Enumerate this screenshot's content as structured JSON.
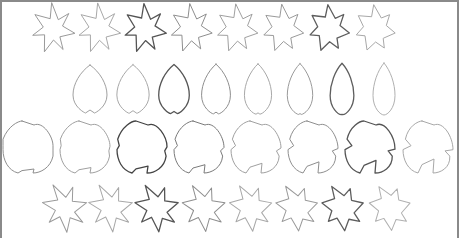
{
  "figure": {
    "rows": [
      {
        "name": "maple-row-top",
        "shape": "maple",
        "y_center": 29,
        "scale": 1.0,
        "rotation": 0,
        "x_centers": [
          53,
          99,
          145,
          191,
          237,
          283,
          329,
          375
        ],
        "strokes": [
          "#9a9a9a",
          "#a8a8a8",
          "#555555",
          "#8e8e8e",
          "#a0a0a0",
          "#9a9a9a",
          "#5e5e5e",
          "#a8a8a8"
        ]
      },
      {
        "name": "ovate-row",
        "shape": "ovate",
        "y_center": 89,
        "scale": 1.0,
        "rotation": 0,
        "x_centers": [
          90,
          133,
          174,
          216,
          258,
          300,
          342,
          384
        ],
        "strokes": [
          "#a0a0a0",
          "#a8a8a8",
          "#555555",
          "#8e8e8e",
          "#a8a8a8",
          "#9a9a9a",
          "#5e5e5e",
          "#b0b0b0"
        ]
      },
      {
        "name": "heart-lobed-row",
        "shape": "heart-lobed",
        "y_center": 147,
        "scale": 1.0,
        "rotation": 0,
        "x_centers": [
          28,
          85,
          142,
          199,
          256,
          313,
          370,
          428
        ],
        "strokes": [
          "#8e8e8e",
          "#a0a0a0",
          "#444444",
          "#7a7a7a",
          "#a0a0a0",
          "#8e8e8e",
          "#555555",
          "#a8a8a8"
        ]
      },
      {
        "name": "maple-row-bottom",
        "shape": "maple",
        "y_center": 208,
        "scale": 1.0,
        "rotation": -25,
        "x_centers": [
          65,
          111,
          157,
          204,
          251,
          297,
          343,
          390
        ],
        "strokes": [
          "#9a9a9a",
          "#a8a8a8",
          "#555555",
          "#8e8e8e",
          "#a8a8a8",
          "#9a9a9a",
          "#5e5e5e",
          "#b0b0b0"
        ]
      }
    ]
  }
}
